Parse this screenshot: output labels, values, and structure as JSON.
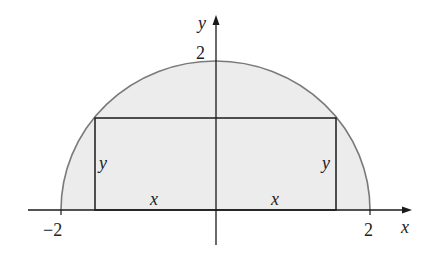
{
  "diagram": {
    "colors": {
      "background": "#ffffff",
      "region_fill": "#ececec",
      "curve_stroke": "#7a7a7a",
      "axis_stroke": "#1a1a1a",
      "rectangle_stroke": "#1a1a1a",
      "text": "#222222"
    },
    "axes": {
      "x_label": "x",
      "y_label": "y",
      "x_ticks": [
        {
          "value": -2,
          "label": "−2"
        },
        {
          "value": 2,
          "label": "2"
        }
      ],
      "y_ticks": [
        {
          "value": 2,
          "label": "2"
        }
      ]
    },
    "semicircle": {
      "radius": 2,
      "center": [
        0,
        0
      ]
    },
    "rectangle": {
      "half_width_label": "x",
      "height_label": "y",
      "left_side_label": "y",
      "right_side_label": "y",
      "left_bottom_label": "x",
      "right_bottom_label": "x"
    }
  }
}
